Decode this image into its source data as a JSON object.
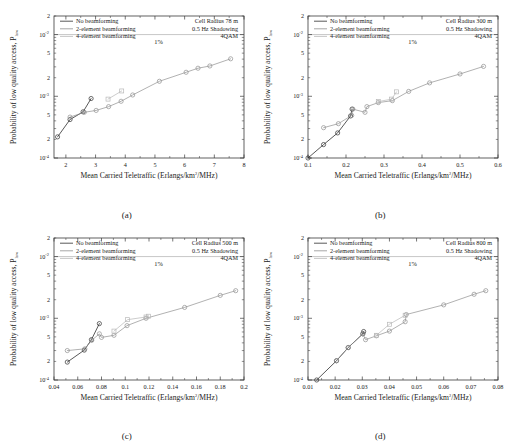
{
  "figure": {
    "n_panels": 4,
    "captions": [
      "(a)",
      "(b)",
      "(c)",
      "(d)"
    ]
  },
  "common": {
    "xlabel_main": "Mean Carried Teletraffic  (Erlangs/km",
    "xlabel_sup": "2",
    "xlabel_tail": "/MHz)",
    "ylabel_main": "Probability of low quality access, P",
    "ylabel_sub": "low",
    "ylim": [
      0.0001,
      0.02
    ],
    "ytick_labels": [
      "10",
      "10",
      "10"
    ],
    "ytick_exponents": [
      "-2",
      "-3",
      "-4"
    ],
    "ytick_values": [
      0.01,
      0.001,
      0.0001
    ],
    "threshold_label": "1%",
    "threshold_value": 0.01,
    "legend": [
      {
        "label": "No beamforming",
        "color": "#2f2f2f"
      },
      {
        "label": "2-element beamforming",
        "color": "#8f8f8f"
      },
      {
        "label": "4-element beamforming",
        "color": "#b8b8b8"
      }
    ],
    "shadowing": "0.5 Hz Shadowing",
    "modulation": "4QAM",
    "marker_no_bf": "open-circle",
    "marker_2el": "open-circle",
    "marker_4el": "open-square"
  },
  "chart_data": [
    {
      "type": "line",
      "panel": "(a)",
      "title": "",
      "xlabel": "Mean Carried Teletraffic (Erlangs/km2/MHz)",
      "ylabel": "Probability of low quality access, Plow",
      "yscale": "log",
      "xlim": [
        1.6,
        8
      ],
      "ylim": [
        0.0001,
        0.02
      ],
      "xticks": [
        2,
        3,
        4,
        5,
        6,
        7,
        8
      ],
      "xtick_labels": [
        "2",
        "3",
        "4",
        "5",
        "6",
        "7",
        "8"
      ],
      "annotations": {
        "cell_radius": "Cell Radius 78 m",
        "shadowing": "0.5 Hz Shadowing",
        "modulation": "4QAM",
        "threshold": "1%"
      },
      "grid": false,
      "legend_position": "top-left",
      "series": [
        {
          "name": "No beamforming",
          "marker": "open-circle",
          "color": "#2f2f2f",
          "x": [
            1.72,
            2.14,
            2.58,
            2.85
          ],
          "y": [
            0.00022,
            0.00042,
            0.00056,
            0.00092
          ]
        },
        {
          "name": "2-element beamforming",
          "marker": "open-circle",
          "color": "#8f8f8f",
          "x": [
            2.14,
            2.62,
            3.02,
            3.44,
            3.86,
            4.25,
            5.15,
            6.05,
            6.45,
            6.85,
            7.55
          ],
          "y": [
            0.00046,
            0.00055,
            0.00059,
            0.00068,
            0.00083,
            0.00105,
            0.00175,
            0.00245,
            0.00285,
            0.0031,
            0.00405
          ]
        },
        {
          "name": "4-element beamforming",
          "marker": "open-square",
          "color": "#b8b8b8",
          "x": [
            3.42,
            3.88
          ],
          "y": [
            0.0009,
            0.00122
          ]
        }
      ]
    },
    {
      "type": "line",
      "panel": "(b)",
      "title": "",
      "xlabel": "Mean Carried Teletraffic (Erlangs/km2/MHz)",
      "ylabel": "Probability of low quality access, Plow",
      "yscale": "log",
      "xlim": [
        0.1,
        0.6
      ],
      "ylim": [
        0.0001,
        0.02
      ],
      "xticks": [
        0.1,
        0.2,
        0.3,
        0.4,
        0.5,
        0.6
      ],
      "xtick_labels": [
        "0.1",
        "0.2",
        "0.3",
        "0.4",
        "0.5",
        "0.6"
      ],
      "annotations": {
        "cell_radius": "Cell Radius 300 m",
        "shadowing": "0.5 Hz Shadowing",
        "modulation": "4QAM",
        "threshold": "1%"
      },
      "grid": false,
      "legend_position": "top-left",
      "series": [
        {
          "name": "No beamforming",
          "marker": "open-circle",
          "color": "#2f2f2f",
          "x": [
            0.1,
            0.141,
            0.178,
            0.212,
            0.216
          ],
          "y": [
            0.0001,
            0.000165,
            0.000255,
            0.00048,
            0.00062
          ]
        },
        {
          "name": "2-element beamforming",
          "marker": "open-circle",
          "color": "#8f8f8f",
          "x": [
            0.141,
            0.18,
            0.215,
            0.218,
            0.25,
            0.255,
            0.285,
            0.322,
            0.365,
            0.42,
            0.5,
            0.562
          ],
          "y": [
            0.00031,
            0.00036,
            0.00049,
            0.00062,
            0.00055,
            0.00068,
            0.00079,
            0.00085,
            0.0012,
            0.00165,
            0.0023,
            0.00305
          ]
        },
        {
          "name": "4-element beamforming",
          "marker": "open-square",
          "color": "#b8b8b8",
          "x": [
            0.285,
            0.32,
            0.333
          ],
          "y": [
            0.00082,
            0.0009,
            0.00118
          ]
        }
      ]
    },
    {
      "type": "line",
      "panel": "(c)",
      "title": "",
      "xlabel": "Mean Carried Teletraffic (Erlangs/km2/MHz)",
      "ylabel": "Probability of low quality access, Plow",
      "yscale": "log",
      "xlim": [
        0.04,
        0.2
      ],
      "ylim": [
        0.0001,
        0.02
      ],
      "xticks": [
        0.04,
        0.06,
        0.08,
        0.1,
        0.12,
        0.14,
        0.16,
        0.18,
        0.2
      ],
      "xtick_labels": [
        "0.04",
        "0.06",
        "0.08",
        "0.1",
        "0.12",
        "0.14",
        "0.16",
        "0.18",
        "0.2"
      ],
      "annotations": {
        "cell_radius": "Cell Radius 500 m",
        "shadowing": "0.5 Hz Shadowing",
        "modulation": "4QAM",
        "threshold": "1%"
      },
      "grid": false,
      "legend_position": "top-left",
      "series": [
        {
          "name": "No beamforming",
          "marker": "open-circle",
          "color": "#2f2f2f",
          "x": [
            0.0512,
            0.0655,
            0.0715,
            0.0782
          ],
          "y": [
            0.000195,
            0.000305,
            0.00045,
            0.00082
          ]
        },
        {
          "name": "2-element beamforming",
          "marker": "open-circle",
          "color": "#8f8f8f",
          "x": [
            0.0512,
            0.066,
            0.0718,
            0.0782,
            0.08,
            0.0905,
            0.1015,
            0.1175,
            0.15,
            0.18,
            0.193
          ],
          "y": [
            0.0003,
            0.00032,
            0.00044,
            0.00056,
            0.00049,
            0.00053,
            0.00076,
            0.001,
            0.0015,
            0.00235,
            0.0028
          ]
        },
        {
          "name": "4-element beamforming",
          "marker": "open-square",
          "color": "#b8b8b8",
          "x": [
            0.0905,
            0.102,
            0.1175,
            0.1195
          ],
          "y": [
            0.00062,
            0.00095,
            0.00105,
            0.00108
          ]
        }
      ]
    },
    {
      "type": "line",
      "panel": "(d)",
      "title": "",
      "xlabel": "Mean Carried Teletraffic (Erlangs/km2/MHz)",
      "ylabel": "Probability of low quality access, Plow",
      "yscale": "log",
      "xlim": [
        0.01,
        0.08
      ],
      "ylim": [
        0.0001,
        0.02
      ],
      "xticks": [
        0.01,
        0.02,
        0.03,
        0.04,
        0.05,
        0.06,
        0.07,
        0.08
      ],
      "xtick_labels": [
        "0.01",
        "0.02",
        "0.03",
        "0.04",
        "0.05",
        "0.06",
        "0.07",
        "0.08"
      ],
      "annotations": {
        "cell_radius": "Cell Radius 800 m",
        "shadowing": "0.5 Hz Shadowing",
        "modulation": "4QAM",
        "threshold": "1%"
      },
      "grid": false,
      "legend_position": "top-left",
      "series": [
        {
          "name": "No beamforming",
          "marker": "open-circle",
          "color": "#2f2f2f",
          "x": [
            0.0132,
            0.0205,
            0.0248,
            0.0302,
            0.0305
          ],
          "y": [
            0.0001,
            0.000205,
            0.000335,
            0.00056,
            0.00061
          ]
        },
        {
          "name": "2-element beamforming",
          "marker": "open-circle",
          "color": "#8f8f8f",
          "x": [
            0.0205,
            0.0248,
            0.0302,
            0.0312,
            0.0352,
            0.04,
            0.0458,
            0.0462,
            0.06,
            0.0712,
            0.0755
          ],
          "y": [
            0.000205,
            0.000335,
            0.00056,
            0.00045,
            0.00052,
            0.00062,
            0.00088,
            0.00115,
            0.00165,
            0.00245,
            0.0028
          ]
        },
        {
          "name": "4-element beamforming",
          "marker": "open-square",
          "color": "#b8b8b8",
          "x": [
            0.0352,
            0.04,
            0.0458
          ],
          "y": [
            0.00053,
            0.0008,
            0.00112
          ]
        }
      ]
    }
  ]
}
